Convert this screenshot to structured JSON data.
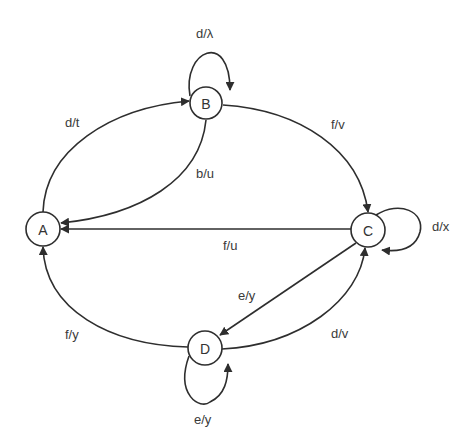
{
  "diagram": {
    "type": "state-machine",
    "colors": {
      "background": "#ffffff",
      "stroke": "#2e2e2e",
      "text": "#333333"
    },
    "nodes": [
      {
        "id": "A",
        "label": "A",
        "x": 43,
        "y": 229
      },
      {
        "id": "B",
        "label": "B",
        "x": 206,
        "y": 103
      },
      {
        "id": "C",
        "label": "C",
        "x": 368,
        "y": 230
      },
      {
        "id": "D",
        "label": "D",
        "x": 205,
        "y": 348
      }
    ],
    "edges": [
      {
        "from": "A",
        "to": "B",
        "label": "d/t"
      },
      {
        "from": "B",
        "to": "B",
        "label": "d/λ"
      },
      {
        "from": "B",
        "to": "A",
        "label": "b/u"
      },
      {
        "from": "B",
        "to": "C",
        "label": "f/v"
      },
      {
        "from": "C",
        "to": "C",
        "label": "d/x"
      },
      {
        "from": "C",
        "to": "A",
        "label": "f/u"
      },
      {
        "from": "C",
        "to": "D",
        "label": "e/y"
      },
      {
        "from": "D",
        "to": "C",
        "label": "d/v"
      },
      {
        "from": "D",
        "to": "A",
        "label": "f/y"
      },
      {
        "from": "D",
        "to": "D",
        "label": "e/y"
      }
    ]
  }
}
